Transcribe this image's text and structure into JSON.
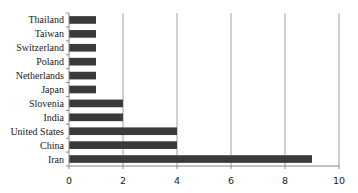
{
  "chart_data": {
    "type": "bar",
    "orientation": "horizontal",
    "title": "",
    "xlabel": "",
    "ylabel": "",
    "categories": [
      "Thailand",
      "Taiwan",
      "Switzerland",
      "Poland",
      "Netherlands",
      "Japan",
      "Slovenia",
      "India",
      "United States",
      "China",
      "Iran"
    ],
    "values": [
      1,
      1,
      1,
      1,
      1,
      1,
      2,
      2,
      4,
      4,
      9
    ],
    "xlim": [
      0,
      10
    ],
    "xticks": [
      0,
      2,
      4,
      6,
      8,
      10
    ],
    "grid": "vertical",
    "legend": null,
    "bar_color": "#3a3a3a",
    "grid_color": "#a0a0a0"
  }
}
